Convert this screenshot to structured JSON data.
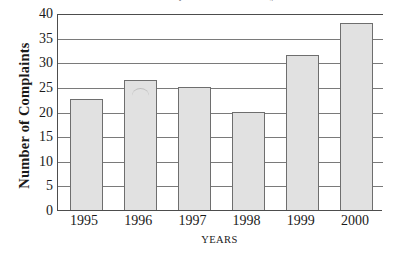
{
  "chart_data": {
    "type": "bar",
    "title": "Number of Complaints Received by Year",
    "xlabel": "YEARS",
    "ylabel": "Number of Complaints",
    "categories": [
      "1995",
      "1996",
      "1997",
      "1998",
      "1999",
      "2000"
    ],
    "values": [
      22.5,
      26.5,
      25,
      20,
      31.5,
      38
    ],
    "ylim": [
      0,
      40
    ],
    "ytick_labels": [
      "0",
      "5",
      "10",
      "15",
      "20",
      "25",
      "30",
      "35",
      "40"
    ],
    "ytick_values": [
      0,
      5,
      10,
      15,
      20,
      25,
      30,
      35,
      40
    ],
    "grid": "horizontal",
    "legend": "none",
    "bar_fill_color": "#e1e1e1",
    "bar_border_color": "#6e6e6e",
    "axis_color": "#4d4d4d",
    "gridline_color": "#7a7a7a",
    "background_color": "#ffffff"
  }
}
